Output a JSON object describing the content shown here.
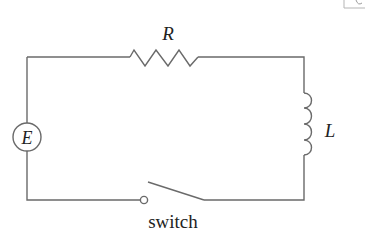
{
  "diagram": {
    "type": "RL circuit",
    "components": {
      "resistor": {
        "label": "R"
      },
      "inductor": {
        "label": "L"
      },
      "source": {
        "label": "E"
      },
      "switch": {
        "label": "switch",
        "state": "open"
      }
    },
    "colors": {
      "wire": "#6a6a6a",
      "text": "#222222",
      "background": "#ffffff"
    }
  }
}
